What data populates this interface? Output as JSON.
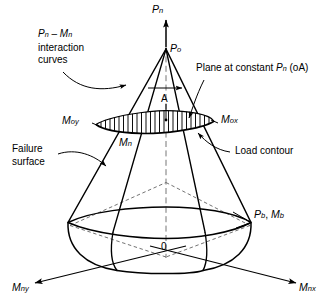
{
  "figure": {
    "type": "engineering-diagram",
    "axes": {
      "vertical": {
        "symbol": "P",
        "subscript": "n"
      },
      "left": {
        "symbol": "M",
        "subscript": "ny"
      },
      "right": {
        "symbol": "M",
        "subscript": "nx"
      },
      "origin": "0"
    },
    "points": {
      "apex": {
        "symbol": "P",
        "subscript": "o"
      },
      "plane_point": "A",
      "balanced": {
        "p_symbol": "P",
        "p_subscript": "b",
        "m_symbol": "M",
        "m_subscript": "b",
        "separator": ", "
      },
      "moment_left": {
        "symbol": "M",
        "subscript": "oy"
      },
      "moment_right": {
        "symbol": "M",
        "subscript": "ox"
      },
      "moment_mid": {
        "symbol": "M",
        "subscript": "n"
      }
    },
    "annotations": {
      "interaction_curves": {
        "line1_symbol_a": "P",
        "line1_sub_a": "n",
        "line1_dash": " – ",
        "line1_symbol_b": "M",
        "line1_sub_b": "n",
        "line2": "interaction",
        "line3": "curves"
      },
      "plane_at_constant": {
        "prefix": "Plane at constant ",
        "symbol": "P",
        "subscript": "n",
        "suffix": " (oA)"
      },
      "load_contour": "Load contour",
      "failure_surface": {
        "line1": "Failure",
        "line2": "surface"
      }
    },
    "colors": {
      "stroke": "#000000",
      "background": "#ffffff",
      "dashed": "#555555",
      "hatch": "#000000"
    }
  }
}
